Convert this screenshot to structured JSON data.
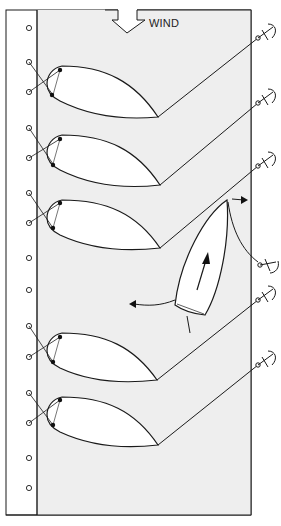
{
  "diagram": {
    "wind_label": "WIND",
    "colors": {
      "panel": "#eeeeee",
      "stroke": "#1a1a1a",
      "sail": "#ffffff",
      "page": "#ffffff"
    },
    "left_track_holes": [
      28,
      62,
      92,
      128,
      158,
      193,
      223,
      258,
      290,
      326,
      357,
      393,
      423,
      458,
      488
    ],
    "sails": [
      {
        "top": 66,
        "clew": [
          158,
          117
        ],
        "sheet_end": [
          262,
          35
        ]
      },
      {
        "top": 135,
        "clew": [
          160,
          185
        ],
        "sheet_end": [
          262,
          100
        ]
      },
      {
        "top": 200,
        "clew": [
          160,
          248
        ],
        "sheet_end": [
          262,
          163
        ]
      },
      {
        "top": 333,
        "clew": [
          157,
          380
        ],
        "sheet_end": [
          262,
          297
        ]
      },
      {
        "top": 397,
        "clew": [
          158,
          445
        ],
        "sheet_end": [
          262,
          362
        ]
      }
    ],
    "boat": {
      "heading_arrow": "forward",
      "turn_arrow": "rotation"
    }
  }
}
